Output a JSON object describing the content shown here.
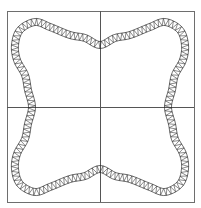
{
  "figure": {
    "colors": {
      "background": "#ffffff",
      "frame": "#6e6e6e",
      "axes": "#555555",
      "ribbon": "#2a2a2a"
    },
    "frame": {
      "x": 7,
      "y": 11,
      "width": 187,
      "height": 191
    },
    "center": {
      "x": 100,
      "y": 107
    },
    "ribbon_width": 7,
    "zigzag_step": 2.2,
    "quadrant_points": [
      [
        0,
        -62
      ],
      [
        15,
        -69
      ],
      [
        30,
        -72
      ],
      [
        50,
        -80
      ],
      [
        65,
        -85
      ],
      [
        80,
        -77
      ],
      [
        85,
        -62
      ],
      [
        83,
        -47
      ],
      [
        75,
        -32
      ],
      [
        72,
        -17
      ],
      [
        68,
        0
      ]
    ]
  }
}
